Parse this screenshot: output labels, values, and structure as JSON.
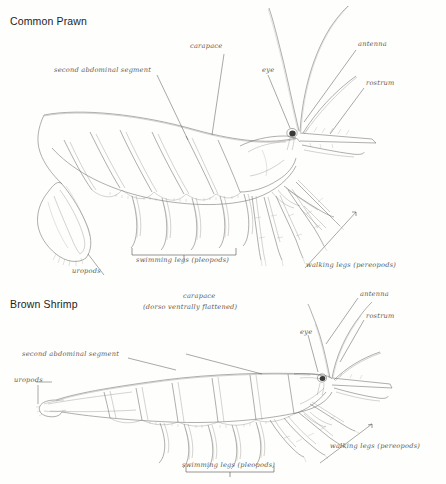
{
  "plate": {
    "background_color": "#fefefc",
    "ink_color": "#5c5a57",
    "title_color": "#1d1d1d",
    "width": 446,
    "height": 484
  },
  "specimens": [
    {
      "id": "common-prawn",
      "title": "Common Prawn",
      "labels": [
        {
          "key": "second_abdominal_segment",
          "text": "second abdominal segment"
        },
        {
          "key": "carapace",
          "text": "carapace"
        },
        {
          "key": "eye",
          "text": "eye"
        },
        {
          "key": "antenna",
          "text": "antenna"
        },
        {
          "key": "rostrum",
          "text": "rostrum"
        },
        {
          "key": "uropods",
          "text": "uropods"
        },
        {
          "key": "swimming_legs",
          "text": "swimming legs (pleopods)"
        },
        {
          "key": "walking_legs",
          "text": "walking legs (pereopods)"
        }
      ]
    },
    {
      "id": "brown-shrimp",
      "title": "Brown Shrimp",
      "labels": [
        {
          "key": "carapace",
          "text": "carapace"
        },
        {
          "key": "carapace_note",
          "text": "(dorso ventrally flattened)"
        },
        {
          "key": "eye",
          "text": "eye"
        },
        {
          "key": "antenna",
          "text": "antenna"
        },
        {
          "key": "rostrum",
          "text": "rostrum"
        },
        {
          "key": "second_abdominal_segment",
          "text": "second abdominal segment"
        },
        {
          "key": "uropods",
          "text": "uropods"
        },
        {
          "key": "swimming_legs",
          "text": "swimming legs (pleopods)"
        },
        {
          "key": "walking_legs",
          "text": "walking legs (pereopods)"
        }
      ]
    }
  ]
}
